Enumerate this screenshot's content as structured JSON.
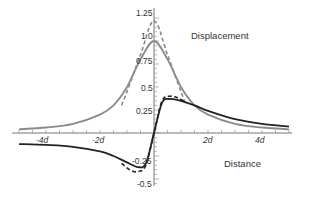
{
  "chart_data": {
    "type": "line",
    "title": "",
    "xlabel": "Distance",
    "ylabel": "Displacement",
    "x_tick_labels": [
      "-4d",
      "-2d",
      "2d",
      "4d"
    ],
    "x_ticks": [
      -4,
      -2,
      2,
      4
    ],
    "y_tick_labels": [
      "1.25",
      "1.0",
      "0.75",
      "0.5",
      "0.25",
      "-0.25",
      "-0.5"
    ],
    "y_ticks": [
      1.25,
      1.0,
      0.75,
      0.5,
      0.25,
      -0.25,
      -0.5
    ],
    "xlim": [
      -5.5,
      5.5
    ],
    "ylim": [
      -0.55,
      1.3
    ],
    "grid": false,
    "legend": "none",
    "annotations": [
      "Displacement",
      "Distance"
    ],
    "series": [
      {
        "name": "vertical displacement (solid, gray)",
        "style": "solid",
        "color": "#8a8a8a",
        "x": [
          -5,
          -4,
          -3,
          -2,
          -1.5,
          -1,
          -0.5,
          0,
          0.5,
          1,
          1.5,
          2,
          3,
          4,
          5
        ],
        "values": [
          0.04,
          0.06,
          0.1,
          0.2,
          0.3,
          0.5,
          0.8,
          1.0,
          0.8,
          0.5,
          0.3,
          0.2,
          0.1,
          0.06,
          0.04
        ]
      },
      {
        "name": "vertical displacement (dashed, gray)",
        "style": "dashed",
        "color": "#8a8a8a",
        "x": [
          -1.2,
          -1,
          -0.5,
          0,
          0.5,
          1,
          1.2
        ],
        "values": [
          0.3,
          0.45,
          0.85,
          1.22,
          0.85,
          0.45,
          0.3
        ]
      },
      {
        "name": "horizontal displacement (solid, black)",
        "style": "solid",
        "color": "#222222",
        "x": [
          -5,
          -4,
          -3,
          -2,
          -1.5,
          -1,
          -0.6,
          -0.3,
          0,
          0.3,
          0.6,
          1,
          1.5,
          2,
          3,
          4,
          5
        ],
        "values": [
          -0.12,
          -0.13,
          -0.15,
          -0.2,
          -0.25,
          -0.32,
          -0.37,
          -0.33,
          0,
          0.33,
          0.37,
          0.35,
          0.3,
          0.24,
          0.15,
          0.1,
          0.07
        ]
      },
      {
        "name": "horizontal displacement (dashed, black)",
        "style": "dashed",
        "color": "#222222",
        "x": [
          -1.2,
          -0.9,
          -0.6,
          -0.3,
          0,
          0.3,
          0.6,
          0.9,
          1.2
        ],
        "values": [
          -0.33,
          -0.4,
          -0.42,
          -0.35,
          0,
          0.35,
          0.4,
          0.38,
          0.33
        ]
      }
    ]
  },
  "labels": {
    "displacement": "Displacement",
    "distance": "Distance",
    "x_ticks": [
      "-4d",
      "-2d",
      "2d",
      "4d"
    ],
    "y_ticks": [
      "1.25",
      "1.0",
      "0.75",
      "0.5",
      "0.25",
      "-0.25",
      "-0.5"
    ]
  }
}
